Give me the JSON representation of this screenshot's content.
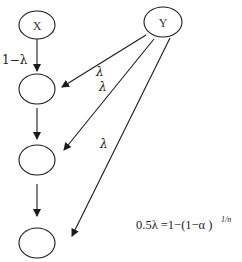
{
  "diagram": {
    "nodes": [
      {
        "id": "X",
        "label": "X"
      },
      {
        "id": "Y",
        "label": "Y"
      },
      {
        "id": "n1",
        "label": ""
      },
      {
        "id": "n2",
        "label": ""
      },
      {
        "id": "n3",
        "label": ""
      }
    ],
    "edges": [
      {
        "from": "X",
        "to": "n1",
        "label": "1−λ"
      },
      {
        "from": "Y",
        "to": "n1",
        "label": "λ"
      },
      {
        "from": "Y",
        "to": "n2",
        "label": "λ"
      },
      {
        "from": "Y",
        "to": "n3",
        "label": "λ"
      },
      {
        "from": "n1",
        "to": "n2",
        "label": ""
      },
      {
        "from": "n2",
        "to": "n3",
        "label": ""
      }
    ],
    "formula": {
      "main": "0.5λ =1−(1−α )",
      "exponent": "1/n"
    }
  }
}
